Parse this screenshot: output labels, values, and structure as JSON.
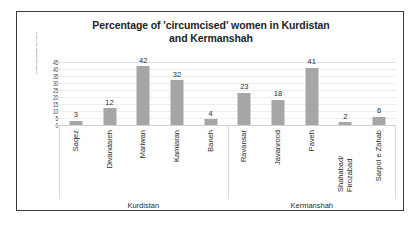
{
  "chart_data": {
    "type": "bar",
    "title": "Percentage of 'circumcised' women in Kurdistan and Kermanshah",
    "title_line1": "Percentage of 'circumcised' women in Kurdistan",
    "title_line2": "and Kermanshah",
    "xlabel": "",
    "ylabel": "Percentage of circumcised women",
    "ylim": [
      0,
      45
    ],
    "grid": true,
    "legend": "none",
    "bar_color": "#a6a6a6",
    "gridline_color": "#ededed",
    "categories": [
      "Saqez",
      "Divandareh",
      "Mariwan",
      "Kamiaran",
      "Baneh",
      "Ravansar",
      "Javanrood",
      "Paveh",
      "Shahabad/ Firozabad",
      "Sarpol e Zahab"
    ],
    "values": [
      3,
      12,
      42,
      32,
      4,
      23,
      18,
      41,
      2,
      6
    ],
    "yticks": [
      "45",
      "40",
      "35",
      "30",
      "25",
      "20",
      "15",
      "10",
      "5",
      "0"
    ],
    "ytick_values": [
      45,
      40,
      35,
      30,
      25,
      20,
      15,
      10,
      5,
      0
    ],
    "groups": [
      {
        "label": "Kurdistan",
        "categories": [
          "Saqez",
          "Divandareh",
          "Mariwan",
          "Kamiaran",
          "Baneh"
        ]
      },
      {
        "label": "Kermanshah",
        "categories": [
          "Ravansar",
          "Javanrood",
          "Paveh",
          "Shahabad/ Firozabad",
          "Sarpol e Zahab"
        ]
      }
    ]
  },
  "categories_display": [
    {
      "line1": "Saqez",
      "line2": ""
    },
    {
      "line1": "Divandareh",
      "line2": ""
    },
    {
      "line1": "Mariwan",
      "line2": ""
    },
    {
      "line1": "Kamiaran",
      "line2": ""
    },
    {
      "line1": "Baneh",
      "line2": ""
    },
    {
      "line1": "Ravansar",
      "line2": ""
    },
    {
      "line1": "Javanrood",
      "line2": ""
    },
    {
      "line1": "Paveh",
      "line2": ""
    },
    {
      "line1": "Shahabad/",
      "line2": "Firozabad"
    },
    {
      "line1": "Sarpol e Zahab",
      "line2": ""
    }
  ]
}
